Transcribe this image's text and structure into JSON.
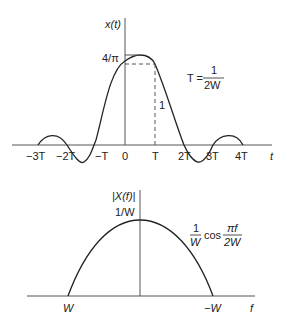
{
  "top_plot": {
    "y_label": "x(t)",
    "x_label": "t",
    "peak_label": "4/π",
    "level_label": "1",
    "ticks": [
      "−3T",
      "−2T",
      "−T",
      "0",
      "T",
      "2T",
      "3T",
      "4T"
    ],
    "annotation": {
      "lhs": "T =",
      "num": "1",
      "den": "2W"
    }
  },
  "bottom_plot": {
    "y_label": "|X(f)|",
    "x_label": "f",
    "peak_label": "1/W",
    "ticks": [
      "W",
      "−W"
    ],
    "annotation": {
      "c_num": "1",
      "c_den": "W",
      "func": "cos",
      "a_num": "πf",
      "a_den": "2W"
    }
  },
  "colors": {
    "line": "#222222",
    "axis": "#555555",
    "background": "#ffffff"
  }
}
